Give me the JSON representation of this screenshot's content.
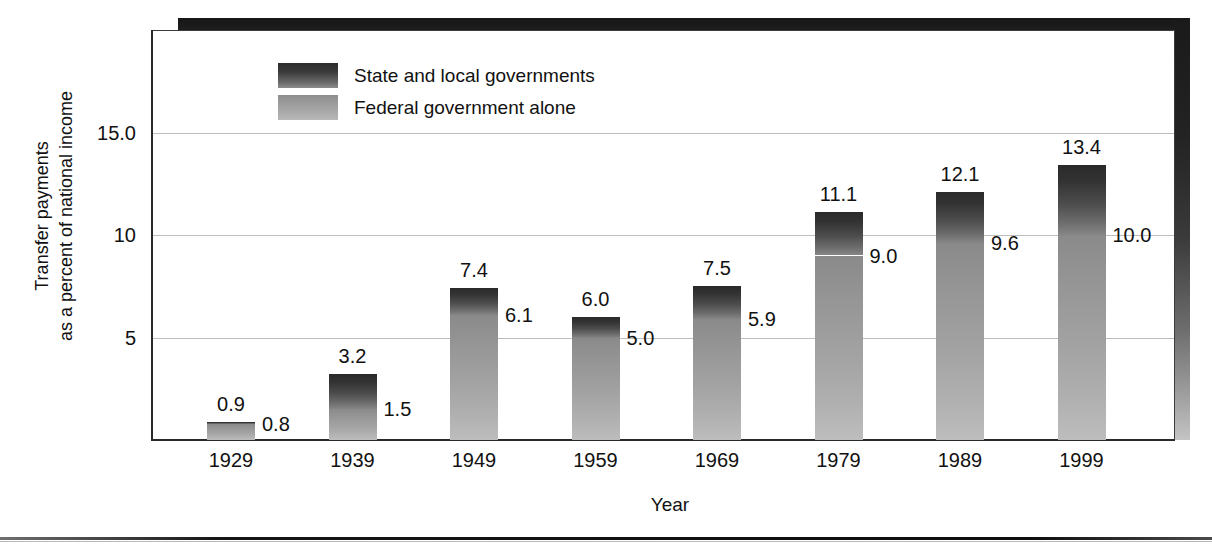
{
  "chart_data": {
    "type": "bar",
    "stacked": true,
    "title": "",
    "xlabel": "Year",
    "ylabel": "Transfer payments\nas a percent of national income",
    "ylim": [
      0,
      16.5
    ],
    "yticks": [
      "5",
      "10",
      "15.0"
    ],
    "ytick_values": [
      5,
      10,
      15
    ],
    "grid": true,
    "legend_position": "top-left-inside",
    "categories": [
      "1929",
      "1939",
      "1949",
      "1959",
      "1969",
      "1979",
      "1989",
      "1999"
    ],
    "series": [
      {
        "name": "Federal government alone",
        "color": "#a3a3a3",
        "values": [
          0.8,
          1.5,
          6.1,
          5.0,
          5.9,
          9.0,
          9.6,
          10.0
        ],
        "labels": [
          "0.8",
          "1.5",
          "6.1",
          "5.0",
          "5.9",
          "9.0",
          "9.6",
          "10.0"
        ]
      },
      {
        "name": "State and local governments",
        "color": "#3a3a3a",
        "values": [
          0.9,
          3.2,
          7.4,
          6.0,
          7.5,
          11.1,
          12.1,
          13.4
        ],
        "note": "values are cumulative totals (federal + state and local)",
        "labels": [
          "0.9",
          "3.2",
          "7.4",
          "6.0",
          "7.5",
          "11.1",
          "12.1",
          "13.4"
        ]
      }
    ]
  },
  "axes": {
    "y_title_line1": "Transfer payments",
    "y_title_line2": "as a percent of national income",
    "x_title": "Year",
    "yticks": [
      {
        "label": "15.0",
        "value": 15
      },
      {
        "label": "10",
        "value": 10
      },
      {
        "label": "5",
        "value": 5
      }
    ],
    "xticks": [
      "1929",
      "1939",
      "1949",
      "1959",
      "1969",
      "1979",
      "1989",
      "1999"
    ]
  },
  "legend": {
    "items": [
      {
        "label": "State and local governments",
        "swatch": "dark-gradient-swatch"
      },
      {
        "label": "Federal government alone",
        "swatch": "light-gradient-swatch"
      }
    ]
  },
  "bars": [
    {
      "year": "1929",
      "total_label": "0.9",
      "federal_label": "0.8",
      "total": 0.9,
      "federal": 0.8
    },
    {
      "year": "1939",
      "total_label": "3.2",
      "federal_label": "1.5",
      "total": 3.2,
      "federal": 1.5
    },
    {
      "year": "1949",
      "total_label": "7.4",
      "federal_label": "6.1",
      "total": 7.4,
      "federal": 6.1
    },
    {
      "year": "1959",
      "total_label": "6.0",
      "federal_label": "5.0",
      "total": 6.0,
      "federal": 5.0
    },
    {
      "year": "1969",
      "total_label": "7.5",
      "federal_label": "5.9",
      "total": 7.5,
      "federal": 5.9
    },
    {
      "year": "1979",
      "total_label": "11.1",
      "federal_label": "9.0",
      "total": 11.1,
      "federal": 9.0
    },
    {
      "year": "1989",
      "total_label": "12.1",
      "federal_label": "9.6",
      "total": 12.1,
      "federal": 9.6
    },
    {
      "year": "1999",
      "total_label": "13.4",
      "federal_label": "10.0",
      "total": 13.4,
      "federal": 10.0
    }
  ],
  "colors": {
    "state_dark": "#3a3a3a",
    "federal_light": "#a3a3a3",
    "gridline": "#bdbdbd",
    "axis": "#2a2a2a",
    "text": "#111111"
  }
}
